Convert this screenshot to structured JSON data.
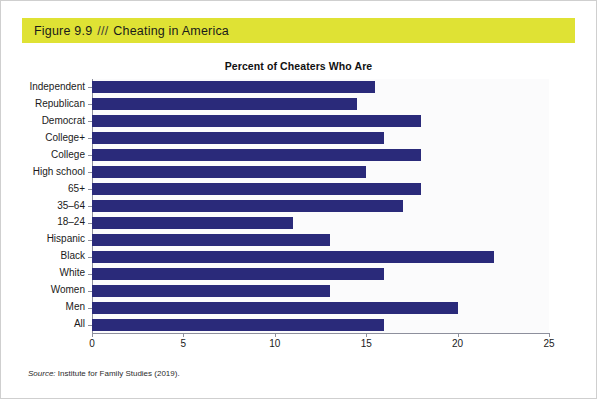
{
  "figure": {
    "caption_prefix": "Figure 9.9",
    "caption_separator": "///",
    "caption_title": "Cheating in America",
    "banner_color": "#dfe234"
  },
  "source": {
    "label": "Source:",
    "text": " Institute for Family Studies (2019)."
  },
  "chart_data": {
    "type": "bar",
    "orientation": "horizontal",
    "title": "Percent of Cheaters Who Are",
    "xlabel": "",
    "ylabel": "",
    "xlim": [
      0,
      25
    ],
    "xticks": [
      "0",
      "5",
      "10",
      "15",
      "20",
      "25"
    ],
    "xtick_values": [
      0,
      5,
      10,
      15,
      20,
      25
    ],
    "grid": false,
    "legend": false,
    "bar_color": "#2a2a7a",
    "categories": [
      "Independent",
      "Republican",
      "Democrat",
      "College+",
      "College",
      "High school",
      "65+",
      "35–64",
      "18–24",
      "Hispanic",
      "Black",
      "White",
      "Women",
      "Men",
      "All"
    ],
    "values": [
      15.5,
      14.5,
      18,
      16,
      18,
      15,
      18,
      17,
      11,
      13,
      22,
      16,
      13,
      20,
      16
    ]
  }
}
